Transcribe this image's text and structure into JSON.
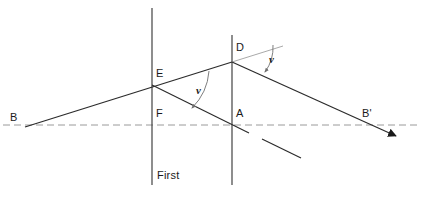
{
  "figure": {
    "type": "optics-ray-diagram",
    "title_visible": false,
    "colors": {
      "ink": "#1a1a1a",
      "ray": "#2b2b2b",
      "construction": "#8a8a8a",
      "axis_dashed": "#9a9a9a",
      "background": "#ffffff"
    }
  },
  "labels": {
    "b": "B",
    "b_prime": "B'",
    "e": "E",
    "f": "F",
    "a": "A",
    "d": "D",
    "angle_left": "v",
    "angle_right": "v",
    "focal_plane_line1": "First",
    "focal_plane_line2": "focal",
    "focal_plane_line3": "plane"
  },
  "geometry": {
    "axis_dashed": {
      "x1": 3,
      "y1": 125,
      "x2": 418,
      "y2": 125
    },
    "focal_plane_vertical": {
      "x": 152,
      "y1": 8,
      "y2": 185
    },
    "lens_plane_vertical": {
      "x": 232,
      "y1": 35,
      "y2": 185
    },
    "incident_ray": {
      "x1": 25,
      "y1": 127,
      "x2": 232,
      "y2": 62
    },
    "construction_extension": {
      "x1": 232,
      "y1": 62,
      "x2": 283,
      "y2": 46
    },
    "emergent_ray": {
      "x1": 232,
      "y1": 62,
      "x2": 399,
      "y2": 137
    },
    "secondary_ray_a": {
      "x1": 152,
      "y1": 85,
      "x2": 249,
      "y2": 133
    },
    "secondary_ray_b": {
      "x1": 262,
      "y1": 139,
      "x2": 301,
      "y2": 158
    },
    "points": {
      "B": [
        25,
        127
      ],
      "E": [
        152,
        85
      ],
      "F": [
        152,
        125
      ],
      "D": [
        232,
        62
      ],
      "A": [
        233,
        125
      ],
      "B_prime": [
        399,
        137
      ]
    }
  },
  "label_positions": {
    "b": [
      10,
      112
    ],
    "e": [
      156,
      68
    ],
    "f": [
      156,
      108
    ],
    "a": [
      236,
      108
    ],
    "d": [
      236,
      42
    ],
    "b_prime": [
      362,
      108
    ],
    "angle_left": [
      196,
      85
    ],
    "angle_right": [
      269,
      54
    ],
    "focal_plane": [
      157,
      143
    ]
  },
  "annotations": {
    "angle_left_arc": {
      "from": "incident ray at E",
      "to": "secondary ray",
      "symbol": "v"
    },
    "angle_right_arc": {
      "from": "construction extension at D",
      "to": "emergent ray",
      "symbol": "v"
    }
  }
}
